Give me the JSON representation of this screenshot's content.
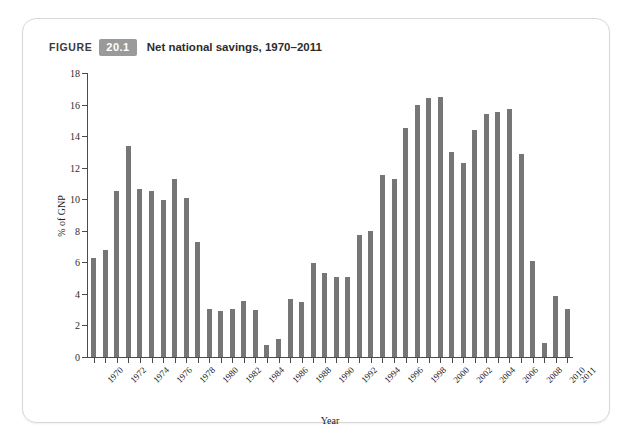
{
  "figure": {
    "kicker": "FIGURE",
    "number": "20.1",
    "title": "Net national savings, 1970–2011"
  },
  "colors": {
    "bar": "#767676",
    "axis": "#4a4a4a",
    "badge_background": "#9a9a9a",
    "card_background": "#ffffff",
    "page_background": "#ffffff"
  },
  "chart_data": {
    "type": "bar",
    "title": "Net national savings, 1970–2011",
    "xlabel": "Year",
    "ylabel": "% of GNP",
    "ylim": [
      0,
      18
    ],
    "ytick_step": 2,
    "yticks": [
      0,
      2,
      4,
      6,
      8,
      10,
      12,
      14,
      16,
      18
    ],
    "grid": false,
    "legend": "none",
    "xtick_label_rotation": -45,
    "xtick_labels": [
      "1970",
      "1972",
      "1974",
      "1976",
      "1978",
      "1980",
      "1982",
      "1984",
      "1986",
      "1988",
      "1990",
      "1992",
      "1994",
      "1996",
      "1998",
      "2000",
      "2002",
      "2004",
      "2006",
      "2008",
      "2010",
      "2011"
    ],
    "categories": [
      "1970",
      "1971",
      "1972",
      "1973",
      "1974",
      "1975",
      "1976",
      "1977",
      "1978",
      "1979",
      "1980",
      "1981",
      "1982",
      "1983",
      "1984",
      "1985",
      "1986",
      "1987",
      "1988",
      "1989",
      "1990",
      "1991",
      "1992",
      "1993",
      "1994",
      "1995",
      "1996",
      "1997",
      "1998",
      "1999",
      "2000",
      "2001",
      "2002",
      "2003",
      "2004",
      "2005",
      "2006",
      "2007",
      "2008",
      "2009",
      "2010",
      "2011"
    ],
    "values": [
      6.3,
      6.8,
      10.5,
      13.35,
      10.65,
      10.55,
      9.95,
      11.3,
      10.1,
      7.3,
      3.05,
      2.9,
      3.05,
      3.55,
      3.0,
      0.75,
      1.15,
      3.65,
      3.5,
      5.95,
      5.35,
      5.1,
      5.1,
      7.75,
      8.0,
      11.55,
      11.3,
      14.5,
      16.0,
      16.4,
      16.5,
      13.0,
      12.3,
      14.4,
      15.4,
      15.5,
      15.7,
      12.85,
      6.1,
      0.9,
      3.85,
      3.05
    ]
  }
}
